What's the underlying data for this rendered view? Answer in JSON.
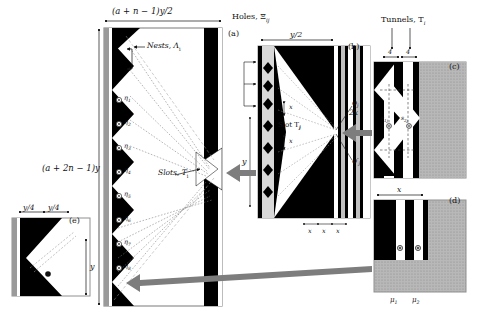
{
  "figure": {
    "type": "technical-diagram",
    "panels": [
      "(a)",
      "(b)",
      "(c)",
      "(d)",
      "(e)"
    ]
  },
  "panel_labels": {
    "a": "(a)",
    "b": "(b)",
    "c": "(c)",
    "d": "(d)",
    "e": "(e)"
  },
  "main": {
    "top_dimension": "(a + n − 1)y/2",
    "left_dimension": "(a + 2n − 1)y",
    "nests_label": "Nests, Λ",
    "nests_sub": "i",
    "slots_label": "Slots, T",
    "slots_sub": "i",
    "eta_markers": [
      {
        "label": "η",
        "sub": "1"
      },
      {
        "label": "η",
        "sub": "2"
      },
      {
        "label": "η",
        "sub": "3"
      },
      {
        "label": "η",
        "sub": "4"
      },
      {
        "label": "η",
        "sub": "5"
      },
      {
        "label": "η",
        "sub": "6"
      },
      {
        "label": "η",
        "sub": "7"
      },
      {
        "label": "η",
        "sub": "8"
      }
    ]
  },
  "middle": {
    "holes_label": "Holes, Ξ",
    "holes_sub": "ij",
    "top_dimension": "y/2",
    "left_dimension": "y",
    "slot_label": "Slot T",
    "slot_sub": "j",
    "spacing_upper": "x",
    "spacing_lower": "x",
    "center_dimension": "2x",
    "phi_label": "φ",
    "phi_sub": "j",
    "phi_prime_label": "φ′",
    "phi_prime_sub": "j",
    "bottom_dimensions": [
      "x",
      "x",
      "x"
    ]
  },
  "panel_c": {
    "tunnels_label": "Tunnels, T",
    "tunnels_sub": "i",
    "dim_left": "4",
    "dim_right": "4",
    "marker_1": "s",
    "marker_1_sub": "1j",
    "marker_2": "s",
    "marker_2_sub": "2j"
  },
  "panel_d": {
    "top_dimension": "x",
    "mu_1": "μ",
    "mu_1_sub": "1",
    "mu_2": "μ",
    "mu_2_sub": "2"
  },
  "panel_e": {
    "dim_left": "y/4",
    "dim_right": "y/4",
    "right_dimension": "y"
  },
  "colors": {
    "black": "#000000",
    "white": "#ffffff",
    "grey_border": "#808080",
    "hatch_grey": "#a8a8a8",
    "arrow_grey": "#808080",
    "light_grey": "#c8c8c8"
  }
}
